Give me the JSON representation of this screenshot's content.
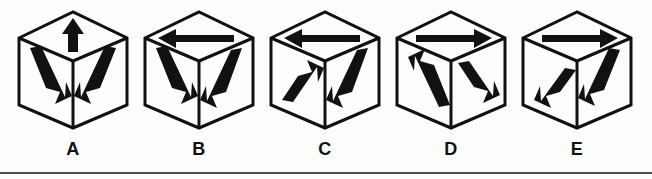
{
  "figure": {
    "kind": "multiple-choice-answer-options",
    "background_color": "#fdfdfd",
    "ink_color": "#111111",
    "rule_color": "#4c4c4c",
    "option_count": 5,
    "options": [
      {
        "label": "A",
        "left": 8,
        "faces": {
          "top": {
            "arrow_direction": "up",
            "description": "arrow pointing up toward back apex"
          },
          "left": {
            "arrow_direction": "down-right",
            "description": "arrow pointing down and to the right"
          },
          "right": {
            "arrow_direction": "down-left",
            "description": "arrow pointing down and to the left"
          }
        }
      },
      {
        "label": "B",
        "left": 134,
        "faces": {
          "top": {
            "arrow_direction": "left",
            "description": "arrow pointing left"
          },
          "left": {
            "arrow_direction": "down-right",
            "description": "arrow pointing down and to the right"
          },
          "right": {
            "arrow_direction": "up-right",
            "description": "arrow pointing up and to the right"
          }
        }
      },
      {
        "label": "C",
        "left": 260,
        "faces": {
          "top": {
            "arrow_direction": "left",
            "description": "arrow pointing left"
          },
          "left": {
            "arrow_direction": "down-left",
            "description": "arrow pointing down and to the left"
          },
          "right": {
            "arrow_direction": "up-right",
            "description": "arrow pointing up and to the right"
          }
        }
      },
      {
        "label": "D",
        "left": 386,
        "faces": {
          "top": {
            "arrow_direction": "right",
            "description": "arrow pointing right"
          },
          "left": {
            "arrow_direction": "up-left",
            "description": "arrow pointing up and to the left"
          },
          "right": {
            "arrow_direction": "up-left",
            "description": "arrow pointing up and to the left"
          }
        }
      },
      {
        "label": "E",
        "left": 512,
        "faces": {
          "top": {
            "arrow_direction": "right",
            "description": "arrow pointing right"
          },
          "left": {
            "arrow_direction": "up-right",
            "description": "arrow pointing up and to the right"
          },
          "right": {
            "arrow_direction": "down-left",
            "description": "arrow pointing down and to the left"
          }
        }
      }
    ]
  }
}
